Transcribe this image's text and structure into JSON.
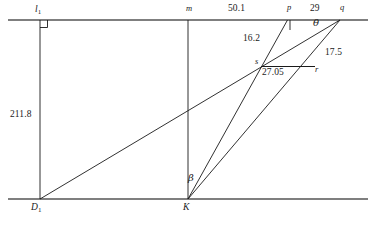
{
  "figure": {
    "kind": "geometry-diagram",
    "stroke_color": "#1a1a1a",
    "baseline_color": "#555555",
    "background": "#ffffff"
  },
  "points": {
    "l1": {
      "label": "l",
      "subscript": "1",
      "x": 38,
      "y": 12
    },
    "m": {
      "label": "m",
      "x": 189,
      "y": 10
    },
    "p": {
      "label": "p",
      "x": 289,
      "y": 10
    },
    "q": {
      "label": "q",
      "x": 342,
      "y": 10
    },
    "s": {
      "label": "s",
      "x": 262,
      "y": 62
    },
    "r": {
      "label": "r",
      "x": 315,
      "y": 70
    },
    "D1": {
      "label": "D",
      "subscript": "1",
      "x": 33,
      "y": 207
    },
    "K": {
      "label": "K",
      "x": 185,
      "y": 207
    }
  },
  "measurements": {
    "top_pm": {
      "value": "50.1",
      "x": 231,
      "y": 10
    },
    "top_pq": {
      "value": "29",
      "x": 313,
      "y": 10
    },
    "sp": {
      "value": "16.2",
      "x": 252,
      "y": 39
    },
    "qr": {
      "value": "17.5",
      "x": 332,
      "y": 53
    },
    "sr": {
      "value": "27.05",
      "x": 266,
      "y": 73
    },
    "left_height": {
      "value": "211.8",
      "x": 14,
      "y": 114
    }
  },
  "angles": {
    "theta": {
      "symbol": "θ",
      "x": 317,
      "y": 23
    },
    "beta": {
      "symbol": "β",
      "x": 190,
      "y": 178
    }
  },
  "marks": {
    "right_angle_at_l1": {
      "present": true,
      "x": 40,
      "y": 22
    },
    "tick_below_p": {
      "present": true,
      "x": 290,
      "y": 20
    }
  },
  "lines": {
    "top_line": {
      "x1": 8,
      "y1": 20,
      "x2": 368,
      "y2": 20
    },
    "bottom_line": {
      "x1": 8,
      "y1": 199,
      "x2": 368,
      "y2": 199
    },
    "left_vertical": {
      "x1": 40,
      "y1": 20,
      "x2": 40,
      "y2": 199
    },
    "mid_vertical": {
      "x1": 188,
      "y1": 20,
      "x2": 188,
      "y2": 199
    },
    "D1_to_q": {
      "x1": 40,
      "y1": 199,
      "x2": 340,
      "y2": 20
    },
    "K_to_p": {
      "x1": 188,
      "y1": 199,
      "x2": 287,
      "y2": 20
    },
    "K_to_q": {
      "x1": 188,
      "y1": 199,
      "x2": 340,
      "y2": 20
    },
    "s_to_p": {
      "x1": 261,
      "y1": 67,
      "x2": 287,
      "y2": 20
    },
    "s_to_r": {
      "x1": 261,
      "y1": 67,
      "x2": 314,
      "y2": 67
    }
  }
}
